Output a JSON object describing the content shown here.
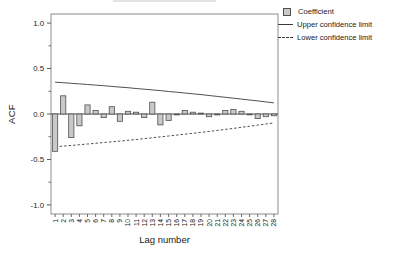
{
  "legend": {
    "items": [
      {
        "label": "Coefficient",
        "swatch": "square-icon"
      },
      {
        "label": "Upper confidence limit",
        "swatch": "solid-line-icon"
      },
      {
        "label": "Lower confidence limit",
        "swatch": "dashed-line-icon"
      }
    ]
  },
  "chart_data": {
    "type": "bar",
    "title": "",
    "xlabel": "Lag number",
    "ylabel": "ACF",
    "x": [
      1,
      2,
      3,
      4,
      5,
      6,
      7,
      8,
      9,
      10,
      11,
      12,
      13,
      14,
      15,
      16,
      17,
      18,
      19,
      20,
      21,
      22,
      23,
      24,
      25,
      26,
      27,
      28
    ],
    "series": [
      {
        "name": "Coefficient",
        "type": "bar",
        "values": [
          -0.41,
          0.2,
          -0.26,
          -0.13,
          0.1,
          0.04,
          -0.04,
          0.08,
          -0.08,
          0.03,
          0.02,
          -0.04,
          0.13,
          -0.12,
          -0.07,
          -0.01,
          0.04,
          0.02,
          0.01,
          -0.03,
          -0.01,
          0.04,
          0.05,
          0.03,
          -0.01,
          -0.05,
          -0.03,
          -0.02
        ]
      },
      {
        "name": "Upper confidence limit",
        "type": "line",
        "style": "solid",
        "values": [
          0.35,
          0.344,
          0.338,
          0.331,
          0.325,
          0.318,
          0.311,
          0.304,
          0.296,
          0.289,
          0.281,
          0.273,
          0.265,
          0.257,
          0.248,
          0.24,
          0.231,
          0.222,
          0.213,
          0.203,
          0.194,
          0.184,
          0.174,
          0.164,
          0.154,
          0.144,
          0.133,
          0.122
        ]
      },
      {
        "name": "Lower confidence limit",
        "type": "line",
        "style": "dashed",
        "values": [
          -0.36,
          -0.353,
          -0.346,
          -0.338,
          -0.33,
          -0.322,
          -0.314,
          -0.306,
          -0.298,
          -0.289,
          -0.28,
          -0.271,
          -0.262,
          -0.252,
          -0.242,
          -0.232,
          -0.222,
          -0.212,
          -0.202,
          -0.191,
          -0.18,
          -0.169,
          -0.158,
          -0.146,
          -0.134,
          -0.122,
          -0.11,
          -0.098
        ]
      }
    ],
    "ylim": [
      -1.1,
      1.1
    ],
    "y_ticks": [
      {
        "v": 1.0,
        "label": "1.0"
      },
      {
        "v": 0.5,
        "label": "0.5"
      },
      {
        "v": 0.0,
        "label": "0.0"
      },
      {
        "v": -0.5,
        "label": "-0.5"
      },
      {
        "v": -1.0,
        "label": "-1.0"
      }
    ],
    "y_minor_ticks": [
      0.75,
      0.25,
      -0.25,
      -0.75
    ],
    "grid": false,
    "legend_position": "top-right-outside"
  },
  "colors": {
    "background": "#ffffff",
    "bar_fill": "#c9c9c9",
    "bar_stroke": "#4f4f4f",
    "line": "#3c3c3c",
    "axis_frame": "#8c8c8c",
    "tick": "#5a5a5a",
    "text": "#1a1a1a",
    "cropped_fragment": "#e3e3e3"
  }
}
